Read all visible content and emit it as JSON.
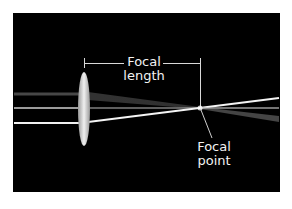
{
  "diagram": {
    "labels": {
      "focal_length_line1": "Focal",
      "focal_length_line2": "length",
      "focal_point_line1": "Focal",
      "focal_point_line2": "point"
    },
    "colors": {
      "background": "#000000",
      "frame": "#ffffff",
      "rays": "#e8e8e8",
      "lens": "#dcdcdc",
      "text": "#f2f2f2"
    }
  }
}
